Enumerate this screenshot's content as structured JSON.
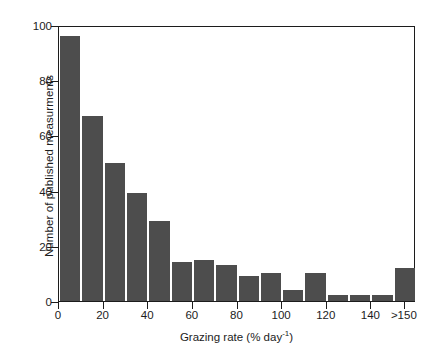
{
  "chart_data": {
    "type": "bar",
    "title": "",
    "subtitle": "",
    "xlabel": "Grazing rate (% day",
    "xlabel_exponent": "-1",
    "xlabel_suffix": ")",
    "ylabel": "Number of published measurments",
    "xlim": [
      0,
      160
    ],
    "ylim": [
      0,
      100
    ],
    "grid": false,
    "legend": null,
    "bar_color": "#4d4d4d",
    "axis_color": "#1c1c1c",
    "background": "#ffffff",
    "bin_width": 10,
    "categories": [
      "0-10",
      "10-20",
      "20-30",
      "30-40",
      "40-50",
      "50-60",
      "60-70",
      "70-80",
      "80-90",
      "90-100",
      "100-110",
      "110-120",
      "120-130",
      "130-140",
      "140-150",
      ">150"
    ],
    "bin_starts": [
      0,
      10,
      20,
      30,
      40,
      50,
      60,
      70,
      80,
      90,
      100,
      110,
      120,
      130,
      140,
      150
    ],
    "values": [
      96,
      67,
      50,
      39,
      29,
      14,
      15,
      13,
      9,
      10,
      4,
      10,
      2,
      2,
      2,
      12
    ],
    "ytick_values": [
      0,
      20,
      40,
      60,
      80,
      100
    ],
    "ytick_labels": [
      "0",
      "20",
      "40",
      "60",
      "80",
      "100"
    ],
    "xtick_values": [
      0,
      20,
      40,
      60,
      80,
      100,
      120,
      140,
      155
    ],
    "xtick_labels": [
      "0",
      "20",
      "40",
      "60",
      "80",
      "100",
      "120",
      "140",
      ">150"
    ]
  }
}
